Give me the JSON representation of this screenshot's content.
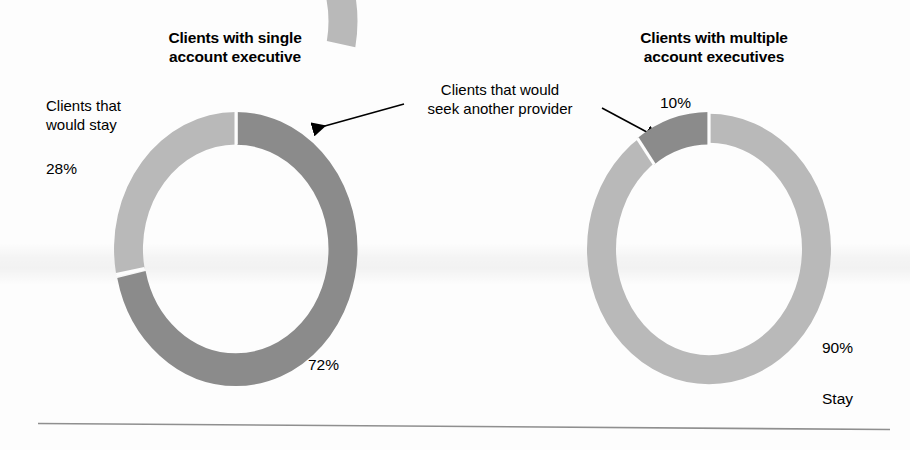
{
  "chart_data": [
    {
      "type": "pie",
      "title": "Clients with single account executive",
      "categories": [
        "Clients that would stay",
        "Clients that would seek another provider"
      ],
      "values": [
        28,
        72
      ],
      "value_labels": [
        "28%",
        "72%"
      ],
      "colors": [
        "#b9b9b9",
        "#8b8b8b"
      ],
      "unit": "%",
      "donut": true,
      "start_angle_deg": 0,
      "direction": "counterclockwise-for-stay",
      "legend": "annotated",
      "grid": false
    },
    {
      "type": "pie",
      "title": "Clients with multiple account executives",
      "categories": [
        "Stay",
        "Clients that would seek another provider"
      ],
      "values": [
        90,
        10
      ],
      "value_labels": [
        "90%",
        "10%"
      ],
      "colors": [
        "#b9b9b9",
        "#8b8b8b"
      ],
      "unit": "%",
      "donut": true,
      "start_angle_deg": 0,
      "direction": "counterclockwise-for-seek",
      "legend": "annotated",
      "grid": false
    }
  ],
  "left_chart": {
    "title_line1": "Clients with single",
    "title_line2": "account executive",
    "stay_label_line1": "Clients that",
    "stay_label_line2": "would stay",
    "stay_value": "28%",
    "seek_value": "72%"
  },
  "right_chart": {
    "title_line1": "Clients with multiple",
    "title_line2": "account executives",
    "seek_value": "10%",
    "stay_value": "90%",
    "stay_label": "Stay"
  },
  "shared_annotation": {
    "line1": "Clients that would",
    "line2": "seek another provider"
  },
  "palette": {
    "light_gray": "#b9b9b9",
    "dark_gray": "#8b8b8b",
    "text": "#000000",
    "rule": "#8f8f8f",
    "background": "#fdfdfd"
  }
}
